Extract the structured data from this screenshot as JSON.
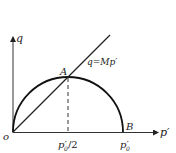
{
  "diagram": {
    "axes": {
      "y_label": "q",
      "x_label": "p′",
      "origin_label": "o"
    },
    "line": {
      "label": "q=Mp′"
    },
    "points": {
      "A": "A",
      "B": "B"
    },
    "ticks": {
      "half": "p′",
      "half_sub": "0",
      "half_suffix": "/2",
      "full": "p′",
      "full_sub": "0"
    },
    "colors": {
      "stroke": "#222222",
      "background": "#ffffff"
    }
  }
}
